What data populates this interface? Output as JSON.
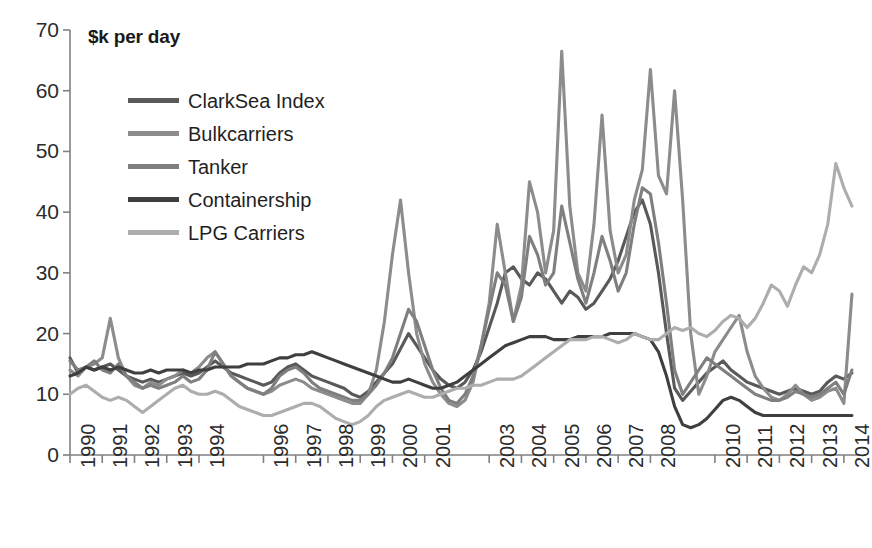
{
  "chart_data": {
    "type": "line",
    "title": "$k per day",
    "xlabel": "",
    "ylabel": "$k per day",
    "ylim": [
      0,
      70
    ],
    "ytick_step": 10,
    "yticks": [
      0,
      10,
      20,
      30,
      40,
      50,
      60,
      70
    ],
    "grid": false,
    "legend_position": "top-left-inside",
    "xlim": [
      1990,
      2014.5
    ],
    "xtick_labels": [
      "1990",
      "1991",
      "1992",
      "1993",
      "1994",
      "1996",
      "1997",
      "1998",
      "1999",
      "2000",
      "2001",
      "2003",
      "2004",
      "2005",
      "2006",
      "2007",
      "2008",
      "2010",
      "2011",
      "2012",
      "2013",
      "2014"
    ],
    "xtick_values": [
      1990,
      1991,
      1992,
      1993,
      1994,
      1996,
      1997,
      1998,
      1999,
      2000,
      2001,
      2003,
      2004,
      2005,
      2006,
      2007,
      2008,
      2010,
      2011,
      2012,
      2013,
      2014
    ],
    "x": [
      1990.0,
      1990.25,
      1990.5,
      1990.75,
      1991.0,
      1991.25,
      1991.5,
      1991.75,
      1992.0,
      1992.25,
      1992.5,
      1992.75,
      1993.0,
      1993.25,
      1993.5,
      1993.75,
      1994.0,
      1994.25,
      1994.5,
      1994.75,
      1995.0,
      1995.25,
      1995.5,
      1995.75,
      1996.0,
      1996.25,
      1996.5,
      1996.75,
      1997.0,
      1997.25,
      1997.5,
      1997.75,
      1998.0,
      1998.25,
      1998.5,
      1998.75,
      1999.0,
      1999.25,
      1999.5,
      1999.75,
      2000.0,
      2000.25,
      2000.5,
      2000.75,
      2001.0,
      2001.25,
      2001.5,
      2001.75,
      2002.0,
      2002.25,
      2002.5,
      2002.75,
      2003.0,
      2003.25,
      2003.5,
      2003.75,
      2004.0,
      2004.25,
      2004.5,
      2004.75,
      2005.0,
      2005.25,
      2005.5,
      2005.75,
      2006.0,
      2006.25,
      2006.5,
      2006.75,
      2007.0,
      2007.25,
      2007.5,
      2007.75,
      2008.0,
      2008.25,
      2008.5,
      2008.75,
      2009.0,
      2009.25,
      2009.5,
      2009.75,
      2010.0,
      2010.25,
      2010.5,
      2010.75,
      2011.0,
      2011.25,
      2011.5,
      2011.75,
      2012.0,
      2012.25,
      2012.5,
      2012.75,
      2013.0,
      2013.25,
      2013.5,
      2013.75,
      2014.0,
      2014.25
    ],
    "series": [
      {
        "name": "ClarkSea Index",
        "color": "#595959",
        "values": [
          16.0,
          13.5,
          14.5,
          14.0,
          14.5,
          15.0,
          14.0,
          13.0,
          12.5,
          12.0,
          12.5,
          12.0,
          12.5,
          13.0,
          13.5,
          13.0,
          13.5,
          14.5,
          15.5,
          14.5,
          13.5,
          13.0,
          12.5,
          12.0,
          11.5,
          12.0,
          13.5,
          14.5,
          15.0,
          14.0,
          13.0,
          12.5,
          12.0,
          11.5,
          11.0,
          10.0,
          9.5,
          10.5,
          12.0,
          13.5,
          15.0,
          17.5,
          20.0,
          18.0,
          16.0,
          14.0,
          12.5,
          11.5,
          11.0,
          12.0,
          14.0,
          17.0,
          21.0,
          25.0,
          30.0,
          31.0,
          29.0,
          28.0,
          30.0,
          29.0,
          27.0,
          25.0,
          27.0,
          26.0,
          24.0,
          25.0,
          27.0,
          29.0,
          32.0,
          36.0,
          40.0,
          42.0,
          38.0,
          30.0,
          20.0,
          11.0,
          9.0,
          10.5,
          12.0,
          13.5,
          14.5,
          15.5,
          14.0,
          13.0,
          12.0,
          11.5,
          11.0,
          10.5,
          10.0,
          10.5,
          11.0,
          10.5,
          10.0,
          10.5,
          12.0,
          13.0,
          12.5,
          13.5
        ]
      },
      {
        "name": "Bulkcarriers",
        "color": "#8c8c8c",
        "values": [
          14.0,
          13.0,
          14.5,
          15.0,
          16.0,
          22.5,
          16.0,
          13.0,
          11.5,
          11.0,
          12.0,
          11.5,
          12.5,
          13.0,
          14.0,
          13.5,
          14.5,
          16.0,
          17.0,
          15.0,
          13.0,
          12.0,
          11.0,
          10.5,
          10.0,
          10.5,
          11.5,
          12.0,
          12.5,
          12.0,
          11.0,
          10.5,
          10.0,
          9.5,
          9.0,
          8.5,
          8.5,
          10.0,
          14.0,
          22.0,
          33.0,
          42.0,
          30.0,
          20.0,
          15.0,
          12.0,
          10.0,
          8.5,
          8.0,
          9.0,
          12.0,
          18.0,
          25.0,
          38.0,
          30.0,
          22.0,
          28.0,
          45.0,
          40.0,
          30.0,
          37.0,
          66.5,
          41.0,
          30.0,
          27.0,
          38.0,
          56.0,
          37.0,
          30.0,
          33.0,
          42.0,
          47.0,
          63.5,
          46.0,
          43.0,
          60.0,
          42.0,
          20.0,
          10.0,
          13.0,
          17.0,
          19.0,
          21.0,
          23.0,
          17.0,
          13.0,
          11.0,
          9.5,
          9.0,
          10.0,
          11.5,
          10.0,
          9.0,
          9.5,
          10.5,
          11.0,
          8.5,
          26.5
        ]
      },
      {
        "name": "Tanker",
        "color": "#7f7f7f",
        "values": [
          15.5,
          14.0,
          14.5,
          15.5,
          14.0,
          13.5,
          15.0,
          13.0,
          12.0,
          11.0,
          11.5,
          11.0,
          11.5,
          12.0,
          13.0,
          12.0,
          12.5,
          14.0,
          17.0,
          15.0,
          13.0,
          12.0,
          11.0,
          10.5,
          10.0,
          11.0,
          13.0,
          14.0,
          14.5,
          13.5,
          12.0,
          11.0,
          10.5,
          10.0,
          9.5,
          9.0,
          9.0,
          10.0,
          11.5,
          13.5,
          16.0,
          20.0,
          24.0,
          22.0,
          18.0,
          14.0,
          11.0,
          9.0,
          8.5,
          10.0,
          13.0,
          18.0,
          24.0,
          30.0,
          28.0,
          22.0,
          26.0,
          36.0,
          33.0,
          28.0,
          30.0,
          41.0,
          35.0,
          29.0,
          25.0,
          30.0,
          36.0,
          32.0,
          27.0,
          30.0,
          38.0,
          44.0,
          43.0,
          35.0,
          25.0,
          14.0,
          10.0,
          12.0,
          14.0,
          16.0,
          15.0,
          14.0,
          13.0,
          12.0,
          11.0,
          10.0,
          9.5,
          9.0,
          9.0,
          9.5,
          10.5,
          10.0,
          9.5,
          10.0,
          11.0,
          12.0,
          10.0,
          14.0
        ]
      },
      {
        "name": "Containership",
        "color": "#3f3f3f",
        "values": [
          13.0,
          13.5,
          14.5,
          14.0,
          14.5,
          14.0,
          14.5,
          14.0,
          13.5,
          13.5,
          14.0,
          13.5,
          14.0,
          14.0,
          14.0,
          13.5,
          14.0,
          14.0,
          14.5,
          14.5,
          14.5,
          14.5,
          15.0,
          15.0,
          15.0,
          15.5,
          16.0,
          16.0,
          16.5,
          16.5,
          17.0,
          16.5,
          16.0,
          15.5,
          15.0,
          14.5,
          14.0,
          13.5,
          13.0,
          12.5,
          12.0,
          12.0,
          12.5,
          12.0,
          11.5,
          11.0,
          11.0,
          11.5,
          12.0,
          13.0,
          14.0,
          15.0,
          16.0,
          17.0,
          18.0,
          18.5,
          19.0,
          19.5,
          19.5,
          19.5,
          19.0,
          19.0,
          19.0,
          19.5,
          19.5,
          19.5,
          19.5,
          20.0,
          20.0,
          20.0,
          20.0,
          19.5,
          19.0,
          17.0,
          13.0,
          8.0,
          5.0,
          4.5,
          5.0,
          6.0,
          7.5,
          9.0,
          9.5,
          9.0,
          8.0,
          7.0,
          6.5,
          6.5,
          6.5,
          6.5,
          6.5,
          6.5,
          6.5,
          6.5,
          6.5,
          6.5,
          6.5,
          6.5
        ]
      },
      {
        "name": "LPG Carriers",
        "color": "#adadad",
        "values": [
          10.0,
          11.0,
          11.5,
          10.5,
          9.5,
          9.0,
          9.5,
          9.0,
          8.0,
          7.0,
          8.0,
          9.0,
          10.0,
          11.0,
          11.5,
          10.5,
          10.0,
          10.0,
          10.5,
          10.0,
          9.0,
          8.0,
          7.5,
          7.0,
          6.5,
          6.5,
          7.0,
          7.5,
          8.0,
          8.5,
          8.5,
          8.0,
          7.0,
          6.0,
          5.5,
          5.0,
          5.5,
          6.5,
          8.0,
          9.0,
          9.5,
          10.0,
          10.5,
          10.0,
          9.5,
          9.5,
          10.0,
          10.5,
          11.0,
          11.0,
          11.5,
          11.5,
          12.0,
          12.5,
          12.5,
          12.5,
          13.0,
          14.0,
          15.0,
          16.0,
          17.0,
          18.0,
          19.0,
          19.0,
          19.0,
          19.5,
          19.5,
          19.0,
          18.5,
          19.0,
          20.0,
          19.5,
          19.0,
          19.0,
          20.0,
          21.0,
          20.5,
          21.0,
          20.0,
          19.5,
          20.5,
          22.0,
          23.0,
          22.5,
          21.0,
          22.5,
          25.0,
          28.0,
          27.0,
          24.5,
          28.0,
          31.0,
          30.0,
          33.0,
          38.0,
          48.0,
          44.0,
          41.0
        ]
      }
    ]
  },
  "axis": {
    "y_labels": [
      "70",
      "60",
      "50",
      "40",
      "30",
      "20",
      "10",
      "0"
    ],
    "x_labels": [
      "1990",
      "1991",
      "1992",
      "1993",
      "1994",
      "1996",
      "1997",
      "1998",
      "1999",
      "2000",
      "2001",
      "2003",
      "2004",
      "2005",
      "2006",
      "2007",
      "2008",
      "2010",
      "2011",
      "2012",
      "2013",
      "2014"
    ]
  },
  "title": "$k per day",
  "legend": {
    "items": [
      {
        "label": "ClarkSea Index",
        "color": "#595959"
      },
      {
        "label": "Bulkcarriers",
        "color": "#8c8c8c"
      },
      {
        "label": "Tanker",
        "color": "#7f7f7f"
      },
      {
        "label": "Containership",
        "color": "#3f3f3f"
      },
      {
        "label": "LPG Carriers",
        "color": "#adadad"
      }
    ]
  },
  "colors": {
    "axis": "#808080",
    "text": "#2b2b2b",
    "background": "#ffffff"
  }
}
